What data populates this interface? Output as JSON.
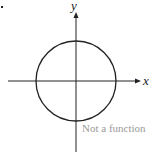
{
  "diagram": {
    "type": "graph",
    "axes": {
      "x_label": "x",
      "y_label": "y"
    },
    "shape": "circle",
    "caption": "Not a function",
    "colors": {
      "stroke": "#222222",
      "caption": "#9a9a9a",
      "background": "#ffffff"
    }
  }
}
